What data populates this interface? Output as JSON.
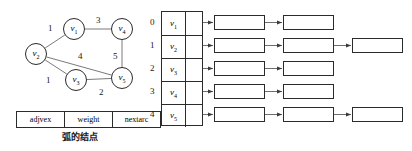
{
  "graph": {
    "vertices": [
      {
        "id": "v1",
        "label": "v",
        "sub": "1",
        "x": 74,
        "y": 29,
        "r": 11
      },
      {
        "id": "v2",
        "label": "v",
        "sub": "2",
        "x": 36,
        "y": 54,
        "r": 11
      },
      {
        "id": "v3",
        "label": "v",
        "sub": "3",
        "x": 76,
        "y": 80,
        "r": 11
      },
      {
        "id": "v4",
        "label": "v",
        "sub": "4",
        "x": 122,
        "y": 29,
        "r": 11
      },
      {
        "id": "v5",
        "label": "v",
        "sub": "5",
        "x": 122,
        "y": 78,
        "r": 11
      }
    ],
    "edges": [
      {
        "from": "v1",
        "to": "v2",
        "weight": "1",
        "lx": 48,
        "ly": 24
      },
      {
        "from": "v1",
        "to": "v4",
        "weight": "3",
        "lx": 96,
        "ly": 16
      },
      {
        "from": "v4",
        "to": "v5",
        "weight": "5",
        "lx": 113,
        "ly": 52
      },
      {
        "from": "v2",
        "to": "v5",
        "weight": "4",
        "lx": 78,
        "ly": 52
      },
      {
        "from": "v2",
        "to": "v3",
        "weight": "1",
        "lx": 46,
        "ly": 76
      },
      {
        "from": "v3",
        "to": "v5",
        "weight": "2",
        "lx": 99,
        "ly": 88
      }
    ]
  },
  "legend": {
    "fields": [
      "adjvex",
      "weight",
      "nextarc"
    ],
    "caption": "弧的结点"
  },
  "adjacency": {
    "indices": [
      "0",
      "1",
      "2",
      "3",
      "4"
    ],
    "vertex_labels": [
      {
        "label": "v",
        "sub": "1"
      },
      {
        "label": "v",
        "sub": "2"
      },
      {
        "label": "v",
        "sub": "3"
      },
      {
        "label": "v",
        "sub": "4"
      },
      {
        "label": "v",
        "sub": "5"
      }
    ],
    "lists": [
      [
        {
          "adjvex": "1",
          "weight": "1",
          "next": "ptr"
        },
        {
          "adjvex": "3",
          "weight": "3",
          "next": "^"
        }
      ],
      [
        {
          "adjvex": "0",
          "weight": "1",
          "next": "ptr"
        },
        {
          "adjvex": "2",
          "weight": "1",
          "next": "ptr"
        },
        {
          "adjvex": "4",
          "weight": "4",
          "next": "^"
        }
      ],
      [
        {
          "adjvex": "1",
          "weight": "1",
          "next": "ptr"
        },
        {
          "adjvex": "4",
          "weight": "2",
          "next": "^"
        }
      ],
      [
        {
          "adjvex": "0",
          "weight": "3",
          "next": "ptr"
        },
        {
          "adjvex": "4",
          "weight": "5",
          "next": "^"
        }
      ],
      [
        {
          "adjvex": "1",
          "weight": "4",
          "next": "ptr"
        },
        {
          "adjvex": "2",
          "weight": "2",
          "next": "ptr"
        },
        {
          "adjvex": "3",
          "weight": "5",
          "next": "^"
        }
      ]
    ],
    "null_marker": "^"
  },
  "colors": {
    "stroke": "#2b2b2b",
    "edge": "#7a7a7a",
    "arrow": "#6e6e6e",
    "text": "#1a1a1a",
    "background": "#ffffff"
  }
}
